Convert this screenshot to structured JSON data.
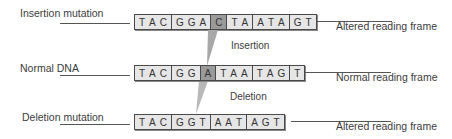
{
  "rows": {
    "insertion": {
      "label": "Insertion mutation",
      "frame": "Altered reading frame",
      "groups": [
        {
          "bases": [
            "T",
            "A",
            "C"
          ],
          "mutation": false
        },
        {
          "bases": [
            "G",
            "G",
            "A"
          ],
          "mutation": false
        },
        {
          "bases": [
            "C"
          ],
          "mutation": true
        },
        {
          "bases": [
            "T",
            "A"
          ],
          "mutation": false
        },
        {
          "bases": [
            "A",
            "T",
            "A"
          ],
          "mutation": false
        },
        {
          "bases": [
            "G",
            "T"
          ],
          "mutation": false
        }
      ]
    },
    "normal": {
      "label": "Normal DNA",
      "frame": "Normal reading frame",
      "groups": [
        {
          "bases": [
            "T",
            "A",
            "C"
          ],
          "mutation": false
        },
        {
          "bases": [
            "G",
            "G"
          ],
          "mutation": false
        },
        {
          "bases": [
            "A"
          ],
          "mutation": true
        },
        {
          "bases": [
            "T",
            "A",
            "A"
          ],
          "mutation": false
        },
        {
          "bases": [
            "T",
            "A",
            "G"
          ],
          "mutation": false
        },
        {
          "bases": [
            "T"
          ],
          "mutation": false
        }
      ]
    },
    "deletion": {
      "label": "Deletion mutation",
      "frame": "Altered reading frame",
      "groups": [
        {
          "bases": [
            "T",
            "A",
            "C"
          ],
          "mutation": false
        },
        {
          "bases": [
            "G",
            "G",
            "T"
          ],
          "mutation": false
        },
        {
          "bases": [
            "A",
            "A",
            "T"
          ],
          "mutation": false
        },
        {
          "bases": [
            "A",
            "G",
            "T"
          ],
          "mutation": false
        }
      ]
    }
  },
  "transitions": {
    "insertion": "Insertion",
    "deletion": "Deletion"
  },
  "colors": {
    "strand_fill": "#e6e6e6",
    "mutated_base": "#9a9a9a",
    "wedge": "#a8a8a8"
  }
}
